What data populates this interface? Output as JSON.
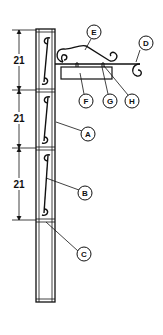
{
  "diagram": {
    "type": "sign-post-assembly",
    "dimensions": [
      {
        "label": "21",
        "from_y": 30,
        "to_y": 90
      },
      {
        "label": "21",
        "from_y": 90,
        "to_y": 148
      },
      {
        "label": "21",
        "from_y": 148,
        "to_y": 220
      }
    ],
    "callouts": [
      {
        "id": "A",
        "label": "A",
        "target": "post-upright"
      },
      {
        "id": "B",
        "label": "B",
        "target": "scroll-infill"
      },
      {
        "id": "C",
        "label": "C",
        "target": "cross-bar"
      },
      {
        "id": "D",
        "label": "D",
        "target": "end-scroll"
      },
      {
        "id": "E",
        "label": "E",
        "target": "bracket-arm"
      },
      {
        "id": "F",
        "label": "F",
        "target": "sign-board"
      },
      {
        "id": "G",
        "label": "G",
        "target": "hanging-eye"
      },
      {
        "id": "H",
        "label": "H",
        "target": "hanging-eye-right"
      }
    ],
    "colors": {
      "line": "#111111",
      "background": "#ffffff"
    }
  }
}
